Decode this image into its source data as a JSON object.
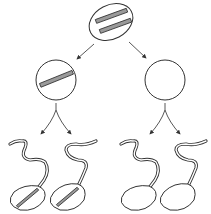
{
  "diagram": {
    "title": "",
    "colors": {
      "background": "#ffffff",
      "outline": "#333333",
      "chromosome_fill": "#9a9a9a"
    },
    "nodes": [
      {
        "id": "parent-cell",
        "shape": "ellipse",
        "chromosomes": 2
      },
      {
        "id": "daughter-cell-left",
        "shape": "circle",
        "chromosomes": 1
      },
      {
        "id": "daughter-cell-right",
        "shape": "circle",
        "chromosomes": 0
      },
      {
        "id": "sperm-1",
        "shape": "sperm",
        "chromosomes": 1
      },
      {
        "id": "sperm-2",
        "shape": "sperm",
        "chromosomes": 1
      },
      {
        "id": "sperm-3",
        "shape": "sperm",
        "chromosomes": 0
      },
      {
        "id": "sperm-4",
        "shape": "sperm",
        "chromosomes": 0
      }
    ],
    "edges": [
      {
        "from": "parent-cell",
        "to": "daughter-cell-left"
      },
      {
        "from": "parent-cell",
        "to": "daughter-cell-right"
      },
      {
        "from": "daughter-cell-left",
        "to": "sperm-1"
      },
      {
        "from": "daughter-cell-left",
        "to": "sperm-2"
      },
      {
        "from": "daughter-cell-right",
        "to": "sperm-3"
      },
      {
        "from": "daughter-cell-right",
        "to": "sperm-4"
      }
    ]
  }
}
